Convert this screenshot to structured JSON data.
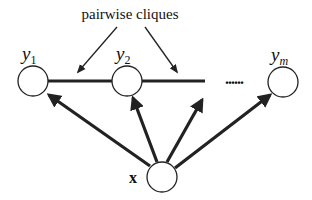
{
  "diagram": {
    "annotation": "pairwise cliques",
    "nodes": [
      {
        "id": "y1",
        "label": "y",
        "sub": "1",
        "cx": 33,
        "cy": 81
      },
      {
        "id": "y2",
        "label": "y",
        "sub": "2",
        "cx": 127,
        "cy": 81
      },
      {
        "id": "ym",
        "label": "y",
        "sub": "m",
        "cx": 283,
        "cy": 82
      },
      {
        "id": "x",
        "label": "x",
        "cx": 162,
        "cy": 177
      }
    ],
    "ellipsis": "......",
    "colors": {
      "stroke": "#222222",
      "fill": "#ffffff"
    }
  }
}
